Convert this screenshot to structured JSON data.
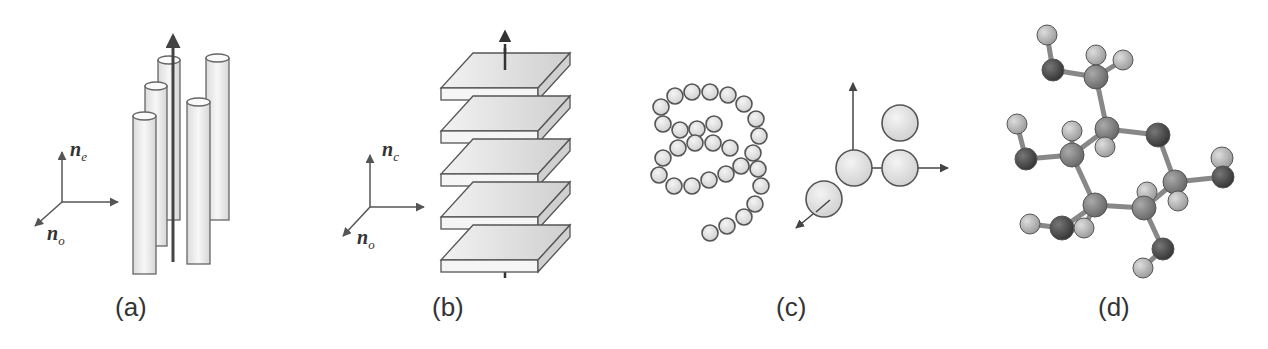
{
  "figure": {
    "panels": [
      {
        "id": "a",
        "caption": "(a)",
        "description": "Calamitic / rod-like columns aligned along director",
        "axis_labels": {
          "vertical": "n",
          "vertical_sub": "e",
          "diagonal": "n",
          "diagonal_sub": "o"
        }
      },
      {
        "id": "b",
        "caption": "(b)",
        "description": "Discotic stacked plates along director",
        "axis_labels": {
          "vertical": "n",
          "vertical_sub": "c",
          "diagonal": "n",
          "diagonal_sub": "o"
        }
      },
      {
        "id": "c",
        "caption": "(c)",
        "description": "Helical bead chain and sphere coordinate system"
      },
      {
        "id": "d",
        "caption": "(d)",
        "description": "Ball-and-stick molecular model (pyranose ring)"
      }
    ],
    "colors": {
      "stroke": "#555555",
      "fill_light": "#eeeeee",
      "fill_mid": "#d9d9d9",
      "atom_dark": "#4a4a4a",
      "atom_mid": "#8a8a8a",
      "atom_light": "#bdbdbd",
      "caption": "#333333"
    }
  }
}
